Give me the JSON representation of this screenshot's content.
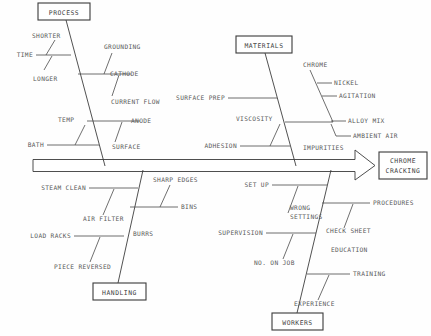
{
  "diagram": {
    "type": "fishbone-ishikawa",
    "effect": {
      "line1": "CHROME",
      "line2": "CRACKING"
    },
    "categories": [
      {
        "id": "process",
        "label": "PROCESS",
        "position": "top-left",
        "causes": [
          "TIME",
          "SHORTER",
          "LONGER",
          "GROUNDING",
          "CATHODE",
          "CURRENT FLOW",
          "TEMP",
          "ANODE",
          "SURFACE",
          "BATH"
        ]
      },
      {
        "id": "materials",
        "label": "MATERIALS",
        "position": "top-right",
        "causes": [
          "SURFACE PREP",
          "CHROME",
          "NICKEL",
          "AGITATION",
          "ALLOY MIX",
          "AMBIENT AIR",
          "VISCOSITY",
          "ADHESION",
          "IMPURITIES"
        ]
      },
      {
        "id": "handling",
        "label": "HANDLING",
        "position": "bottom-left",
        "causes": [
          "STEAM CLEAN",
          "SHARP EDGES",
          "AIR FILTER",
          "BINS",
          "LOAD RACKS",
          "BURRS",
          "PIECE REVERSED"
        ]
      },
      {
        "id": "workers",
        "label": "WORKERS",
        "position": "bottom-right",
        "causes": [
          "SET UP",
          "PROCEDURES",
          "WRONG",
          "SETTINGS",
          "CHECK SHEET",
          "SUPERVISION",
          "EDUCATION",
          "NO. ON JOB",
          "TRAINING",
          "EXPERIENCE"
        ]
      }
    ],
    "labels": {
      "time": "TIME",
      "shorter": "SHORTER",
      "longer": "LONGER",
      "grounding": "GROUNDING",
      "cathode": "CATHODE",
      "current_flow": "CURRENT FLOW",
      "temp": "TEMP",
      "anode": "ANODE",
      "surface": "SURFACE",
      "bath": "BATH",
      "surface_prep": "SURFACE PREP",
      "chrome": "CHROME",
      "nickel": "NICKEL",
      "agitation": "AGITATION",
      "alloy_mix": "ALLOY MIX",
      "ambient_air": "AMBIENT AIR",
      "viscosity": "VISCOSITY",
      "adhesion": "ADHESION",
      "impurities": "IMPURITIES",
      "steam_clean": "STEAM CLEAN",
      "sharp_edges": "SHARP EDGES",
      "air_filter": "AIR FILTER",
      "bins": "BINS",
      "load_racks": "LOAD RACKS",
      "burrs": "BURRS",
      "piece_reversed": "PIECE REVERSED",
      "set_up": "SET UP",
      "procedures": "PROCEDURES",
      "wrong": "WRONG",
      "settings": "SETTINGS",
      "check_sheet": "CHECK SHEET",
      "supervision": "SUPERVISION",
      "education": "EDUCATION",
      "no_on_job": "NO. ON JOB",
      "training": "TRAINING",
      "experience": "EXPERIENCE"
    },
    "colors": {
      "background": "#fefefe",
      "line": "#4a4a4a",
      "text": "#555555",
      "box_border": "#3a3a3a"
    }
  }
}
